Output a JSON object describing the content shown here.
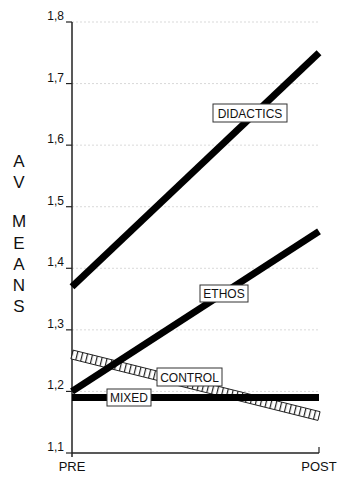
{
  "chart_data": {
    "type": "line",
    "title": "",
    "xlabel": "",
    "ylabel": "AV MEANS",
    "categories": [
      "PRE",
      "POST"
    ],
    "ylim": [
      1.1,
      1.8
    ],
    "yticks": [
      "1,1",
      "1,2",
      "1,3",
      "1,4",
      "1,5",
      "1,6",
      "1,7",
      "1,8"
    ],
    "ytick_values": [
      1.1,
      1.2,
      1.3,
      1.4,
      1.5,
      1.6,
      1.7,
      1.8
    ],
    "grid": true,
    "legend": "inline labels",
    "series": [
      {
        "name": "DIDACTICS",
        "values": [
          1.37,
          1.75
        ],
        "style": "solid-black"
      },
      {
        "name": "ETHOS",
        "values": [
          1.2,
          1.46
        ],
        "style": "solid-black"
      },
      {
        "name": "CONTROL",
        "values": [
          1.26,
          1.16
        ],
        "style": "hatched"
      },
      {
        "name": "MIXED",
        "values": [
          1.19,
          1.19
        ],
        "style": "solid-black"
      }
    ]
  },
  "axis": {
    "ylabel_letters": [
      "A",
      "V",
      "M",
      "E",
      "A",
      "N",
      "S"
    ]
  }
}
